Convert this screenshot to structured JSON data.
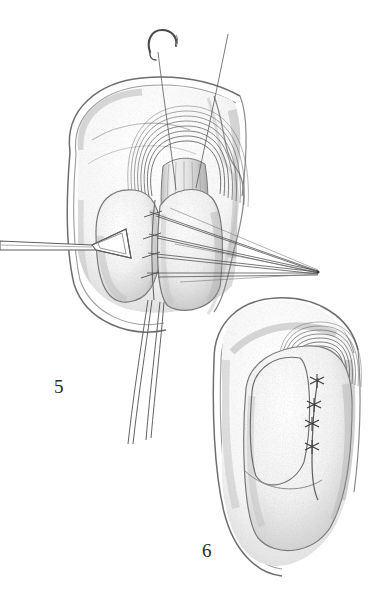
{
  "plate": {
    "title": "Surgical technique plate: hiatal repair and fundoplication",
    "medium": "pencil-and-stipple medical illustration",
    "background_color": "#ffffff",
    "ink_color": "#2a2a2a",
    "shade_color": "#9a9a9a",
    "width": 380,
    "height": 596
  },
  "figures": [
    {
      "id": "figure-5",
      "label": "5",
      "label_x": 54,
      "label_y": 377,
      "caption_text": "5",
      "description": "Stomach fundus and esophageal hiatus with traction sutures placed and held on tension; triangular retractor hook engages the gastric wall on the left; curved needle with suture emerges above.",
      "elements": {
        "diaphragm_rim": {
          "name": "diaphragm-rim-outline",
          "description": "double-contour crescent forming the outer boundary of the operative field"
        },
        "hiatal_ring": {
          "name": "esophageal-hiatus-ring",
          "description": "concentric arcs encircling the distal esophagus",
          "arc_count": 8,
          "center_x": 185,
          "center_y": 180
        },
        "esophagus": {
          "name": "distal-esophagus",
          "description": "vertically striated tubular segment passing through the hiatus"
        },
        "fundus_left": {
          "name": "gastric-fundus-left-lobe"
        },
        "fundus_right": {
          "name": "gastric-fundus-right-lobe"
        },
        "retractor": {
          "name": "triangular-retractor-hook",
          "description": "triangular loop instrument with straight shaft entering from the left margin",
          "shaft_from_x": 0,
          "shaft_to_x": 95,
          "shaft_y": 247,
          "triangle_center_x": 112,
          "triangle_center_y": 243
        },
        "needle": {
          "name": "curved-surgical-needle",
          "description": "half-circle swaged needle with trailing thread at the top of the field",
          "x": 155,
          "y": 38
        }
      },
      "suture_bundle": {
        "name": "traction-suture-bundle",
        "converge_x": 318,
        "converge_y": 272,
        "strand_count": 8,
        "stitch_points": [
          {
            "x": 152,
            "y": 214
          },
          {
            "x": 152,
            "y": 236
          },
          {
            "x": 152,
            "y": 255
          },
          {
            "x": 152,
            "y": 275
          }
        ]
      },
      "suture_tails": {
        "name": "suture-tails-inferior",
        "count": 4,
        "description": "long free suture ends descending below the field"
      },
      "vertical_threads": {
        "name": "suture-threads-superior",
        "count": 2,
        "description": "two threads rising from the hiatus toward the top of the plate"
      }
    },
    {
      "id": "figure-6",
      "label": "6",
      "label_x": 202,
      "label_y": 541,
      "caption_text": "6",
      "description": "Completed repair: the fundal wrap is closed in the midline with four interrupted knotted sutures beneath the reconstructed hiatus.",
      "elements": {
        "diaphragm_rim": {
          "name": "diaphragm-rim-outline"
        },
        "hiatal_ring": {
          "name": "esophageal-hiatus-ring",
          "arc_count": 7,
          "center_x": 318,
          "center_y": 372
        },
        "fundal_wrap": {
          "name": "fundoplication-wrap"
        }
      },
      "knots": {
        "name": "tied-suture-knots",
        "count": 4,
        "points": [
          {
            "x": 317,
            "y": 381
          },
          {
            "x": 314,
            "y": 405
          },
          {
            "x": 312,
            "y": 424
          },
          {
            "x": 312,
            "y": 447
          }
        ]
      },
      "seam": {
        "name": "midline-suture-seam",
        "description": "vertical closure line joining the two leaves of the wrap"
      }
    }
  ]
}
